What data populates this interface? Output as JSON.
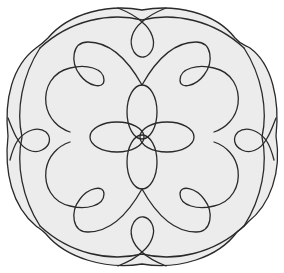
{
  "figure": {
    "title": "Rosette knot line drawing",
    "colors": {
      "background": "#ffffff",
      "fill": "#ececec",
      "stroke": "#2a2a2a"
    },
    "center": [
      142,
      137
    ],
    "symmetry": "4-fold rotational"
  }
}
